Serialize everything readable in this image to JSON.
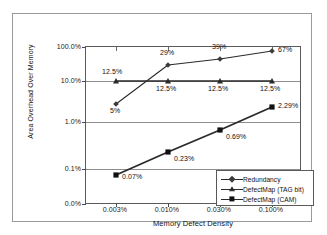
{
  "chart_data": {
    "type": "line",
    "title": "",
    "xlabel": "Memory Defect Density",
    "ylabel": "Area Overhead Over Memory",
    "x_tick_labels": [
      "0.003%",
      "0.010%",
      "0.030%",
      "0.100%"
    ],
    "y_tick_labels": [
      "100.0%",
      "10.0%",
      "1.0%",
      "0.1%",
      "0.0%"
    ],
    "y_scale": "log",
    "grid": true,
    "legend_position": "bottom-right",
    "categories": [
      "0.003%",
      "0.010%",
      "0.030%",
      "0.100%"
    ],
    "series": [
      {
        "name": "Redundancy",
        "marker": "diamond",
        "values": [
          5,
          29,
          39,
          67
        ],
        "point_labels": [
          "5%",
          "29%",
          "39%",
          "67%"
        ]
      },
      {
        "name": "DefectMap (TAG bit)",
        "marker": "triangle",
        "values": [
          12.5,
          12.5,
          12.5,
          12.5
        ],
        "point_labels": [
          "12.5%",
          "12.5%",
          "12.5%",
          "12.5%"
        ]
      },
      {
        "name": "DefectMap (CAM)",
        "marker": "square",
        "values": [
          0.07,
          0.23,
          0.69,
          2.29
        ],
        "point_labels": [
          "0.07%",
          "0.23%",
          "0.69%",
          "2.29%"
        ]
      }
    ],
    "colors": {
      "line": "#2a2a2a",
      "grid": "#8d8d8d",
      "axis": "#5a5a5a",
      "text": "#111111",
      "background": "#ffffff"
    }
  },
  "yticks": [
    {
      "label": "100.0%",
      "top": 0
    },
    {
      "label": "10.0%",
      "top": 34
    },
    {
      "label": "1.0%",
      "top": 75
    },
    {
      "label": "0.1%",
      "top": 122
    },
    {
      "label": "0.0%",
      "top": 157
    }
  ],
  "xticks": [
    {
      "label": "0.003%",
      "left": 30
    },
    {
      "label": "0.010%",
      "left": 82
    },
    {
      "label": "0.030%",
      "left": 134
    },
    {
      "label": "0.100%",
      "left": 186
    }
  ],
  "points": {
    "redundancy": [
      {
        "label": "5%",
        "x": 30,
        "y": 57
      },
      {
        "label": "29%",
        "x": 82,
        "y": 18
      },
      {
        "label": "39%",
        "x": 134,
        "y": 12
      },
      {
        "label": "67%",
        "x": 186,
        "y": 4
      }
    ],
    "tagbit": [
      {
        "label": "12.5%",
        "x": 30,
        "y": 34
      },
      {
        "label": "12.5%",
        "x": 82,
        "y": 34
      },
      {
        "label": "12.5%",
        "x": 134,
        "y": 34
      },
      {
        "label": "12.5%",
        "x": 186,
        "y": 34
      }
    ],
    "cam": [
      {
        "label": "0.07%",
        "x": 30,
        "y": 128
      },
      {
        "label": "0.23%",
        "x": 82,
        "y": 105
      },
      {
        "label": "0.69%",
        "x": 134,
        "y": 83
      },
      {
        "label": "2.29%",
        "x": 186,
        "y": 60
      }
    ]
  },
  "labels": {
    "red_0": "5%",
    "red_1": "29%",
    "red_2": "39%",
    "red_3": "67%",
    "tag_0": "12.5%",
    "tag_1": "12.5%",
    "tag_2": "12.5%",
    "tag_3": "12.5%",
    "cam_0": "0.07%",
    "cam_1": "0.23%",
    "cam_2": "0.69%",
    "cam_3": "2.29%"
  },
  "legend": {
    "items": [
      {
        "label": "Redundancy",
        "marker": "diamond"
      },
      {
        "label": "DefectMap (TAG bit)",
        "marker": "triangle"
      },
      {
        "label": "DefectMap (CAM)",
        "marker": "square"
      }
    ]
  },
  "axes": {
    "x_title": "Memory Defect Density",
    "y_title": "Area Overhead Over Memory"
  }
}
